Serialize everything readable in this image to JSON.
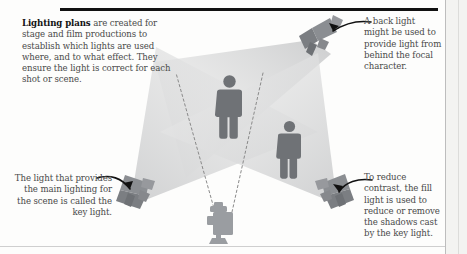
{
  "page": {
    "title": "Lighting plans",
    "top_rule_color": "#111111",
    "background_color": "#fdfdfc"
  },
  "intro": {
    "lead": "Lighting plans",
    "body": " are created for stage and film productions to establish which lights are used where, and to what effect. They ensure the light is correct for each shot or scene."
  },
  "callouts": [
    {
      "id": "back-light",
      "text": "A back light might be used to provide light from behind the focal character.",
      "align": "left",
      "target": "back-light-fixture"
    },
    {
      "id": "key-light",
      "text": "The light that provides the main lighting for the scene is called the key light.",
      "align": "right",
      "target": "key-light-fixture"
    },
    {
      "id": "fill-light",
      "text": "To reduce contrast, the fill light is used to reduce or remove the shadows cast by the key light.",
      "align": "left",
      "target": "fill-light-fixture"
    }
  ],
  "diagram": {
    "type": "lighting-plan",
    "figure_count": 2,
    "camera_count": 1,
    "light_count": 3,
    "colors": {
      "figure": "#6f7276",
      "light_body": "#8b8e92",
      "light_body_dark": "#6e7175",
      "camera": "#9a9da1",
      "beam": "#d9dadb",
      "beam_soft": "#e6e7e8",
      "sight_line": "#8a8a8a",
      "arrow": "#111111"
    },
    "lights": [
      {
        "name": "key-light-fixture",
        "role": "key",
        "position": "bottom-left"
      },
      {
        "name": "fill-light-fixture",
        "role": "fill",
        "position": "bottom-right"
      },
      {
        "name": "back-light-fixture",
        "role": "back",
        "position": "top-right"
      }
    ],
    "figures": [
      {
        "name": "focal-character-figure",
        "position": "center"
      },
      {
        "name": "secondary-character-figure",
        "position": "right"
      }
    ],
    "camera": {
      "name": "camera-icon",
      "position": "bottom-center"
    },
    "sight_lines": 2
  }
}
